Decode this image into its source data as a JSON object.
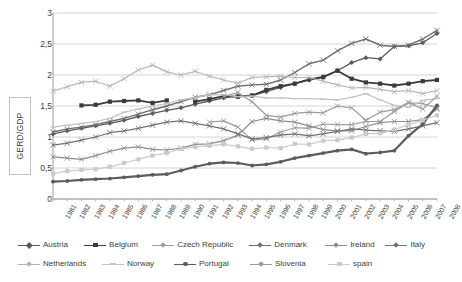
{
  "axis_title": "GERD/GDP",
  "chart_data": {
    "type": "line",
    "title": "",
    "xlabel": "",
    "ylabel": "GERD/GDP",
    "ylim": [
      0,
      3
    ],
    "yticks": [
      0,
      0.5,
      1,
      1.5,
      2,
      2.5,
      3
    ],
    "ytick_labels": [
      "0",
      "0,5",
      "1",
      "1,5",
      "2",
      "2,5",
      "3"
    ],
    "grid": true,
    "legend_position": "bottom",
    "x": [
      1981,
      1982,
      1983,
      1984,
      1985,
      1986,
      1987,
      1988,
      1989,
      1990,
      1991,
      1992,
      1993,
      1994,
      1995,
      1996,
      1997,
      1998,
      1999,
      2000,
      2001,
      2002,
      2003,
      2004,
      2005,
      2006,
      2007,
      2008
    ],
    "xtick_labels": [
      "1981",
      "1982",
      "1983",
      "1984",
      "1985",
      "1986",
      "1987",
      "1988",
      "1989",
      "1990",
      "1991",
      "1992",
      "1993",
      "1994",
      "1995",
      "1996",
      "1997",
      "1998",
      "1999",
      "2000",
      "2001",
      "2002",
      "2003",
      "2004",
      "2005",
      "2006",
      "2007",
      "2008"
    ],
    "series": [
      {
        "name": "Austria",
        "color": "#5a5a5a",
        "marker": "diamond",
        "width": 1.3,
        "values": [
          1.05,
          1.1,
          1.14,
          1.18,
          1.22,
          1.27,
          1.33,
          1.38,
          1.43,
          1.47,
          1.53,
          1.58,
          1.63,
          1.66,
          1.67,
          1.73,
          1.8,
          1.86,
          1.92,
          1.96,
          2.07,
          2.2,
          2.28,
          2.26,
          2.46,
          2.47,
          2.52,
          2.67
        ]
      },
      {
        "name": "Belgium",
        "color": "#3b3b3b",
        "marker": "square",
        "width": 1.8,
        "values": [
          null,
          null,
          1.51,
          1.52,
          1.57,
          1.58,
          1.59,
          1.55,
          1.59,
          null,
          1.57,
          1.61,
          1.66,
          1.65,
          1.67,
          1.76,
          1.82,
          1.86,
          1.93,
          1.97,
          2.07,
          1.94,
          1.88,
          1.86,
          1.83,
          1.86,
          1.9,
          1.92
        ]
      },
      {
        "name": "Czech Republic",
        "color": "#9d9d9d",
        "marker": "cross",
        "width": 1.2,
        "values": [
          null,
          null,
          null,
          null,
          null,
          null,
          null,
          null,
          null,
          null,
          null,
          1.24,
          1.26,
          1.16,
          0.95,
          0.97,
          1.08,
          1.15,
          1.14,
          1.21,
          1.2,
          1.2,
          1.25,
          1.25,
          1.41,
          1.55,
          1.54,
          1.47
        ]
      },
      {
        "name": "Denmark",
        "color": "#6e6e6e",
        "marker": "cross",
        "width": 1.4,
        "values": [
          1.08,
          1.13,
          1.16,
          1.2,
          1.25,
          1.3,
          1.37,
          1.44,
          1.5,
          1.57,
          1.64,
          1.68,
          1.75,
          1.82,
          1.84,
          1.85,
          1.92,
          2.04,
          2.18,
          2.24,
          2.39,
          2.51,
          2.58,
          2.48,
          2.46,
          2.48,
          2.58,
          2.72
        ]
      },
      {
        "name": "Ireland",
        "color": "#8c8c8c",
        "marker": "cross",
        "width": 1.2,
        "values": [
          0.68,
          0.66,
          0.64,
          0.7,
          0.77,
          0.82,
          0.84,
          0.8,
          0.79,
          0.82,
          0.88,
          0.89,
          0.94,
          1.03,
          1.25,
          1.3,
          1.26,
          1.24,
          1.18,
          1.12,
          1.1,
          1.1,
          1.17,
          1.23,
          1.25,
          1.25,
          1.28,
          1.45
        ]
      },
      {
        "name": "Italy",
        "color": "#707070",
        "marker": "cross",
        "width": 1.2,
        "values": [
          0.87,
          0.9,
          0.95,
          1.0,
          1.07,
          1.1,
          1.14,
          1.19,
          1.24,
          1.26,
          1.22,
          1.18,
          1.13,
          1.05,
          0.97,
          0.99,
          1.03,
          1.05,
          1.02,
          1.05,
          1.09,
          1.13,
          1.11,
          1.1,
          1.09,
          1.13,
          1.18,
          1.23
        ]
      },
      {
        "name": "Netherlands",
        "color": "#b5b5b5",
        "marker": "cross",
        "width": 1.2,
        "values": [
          1.74,
          1.81,
          1.88,
          1.9,
          1.82,
          1.94,
          2.08,
          2.16,
          2.05,
          2.0,
          2.06,
          1.98,
          1.92,
          1.87,
          1.96,
          1.97,
          1.98,
          1.96,
          1.96,
          1.9,
          1.84,
          1.79,
          1.8,
          1.77,
          1.73,
          1.75,
          1.7,
          1.75
        ]
      },
      {
        "name": "Norway",
        "color": "#c2c2c2",
        "marker": "dash",
        "width": 1.2,
        "values": [
          1.16,
          1.19,
          1.22,
          1.25,
          1.3,
          1.4,
          1.45,
          1.5,
          1.54,
          1.6,
          1.64,
          1.68,
          1.68,
          1.65,
          1.66,
          1.63,
          1.63,
          1.62,
          1.62,
          1.61,
          1.6,
          1.64,
          1.7,
          1.6,
          1.51,
          1.48,
          1.59,
          1.62
        ]
      },
      {
        "name": "Portugal",
        "color": "#5c5c5c",
        "marker": "round",
        "width": 2.2,
        "values": [
          0.28,
          0.29,
          0.31,
          0.32,
          0.33,
          0.35,
          0.37,
          0.39,
          0.4,
          0.46,
          0.52,
          0.57,
          0.59,
          0.58,
          0.54,
          0.56,
          0.6,
          0.66,
          0.7,
          0.74,
          0.78,
          0.8,
          0.73,
          0.75,
          0.78,
          1.02,
          1.21,
          1.51
        ]
      },
      {
        "name": "Slovenia",
        "color": "#9a9a9a",
        "marker": "cross",
        "width": 1.2,
        "values": [
          null,
          null,
          null,
          null,
          null,
          null,
          null,
          null,
          null,
          null,
          null,
          null,
          1.65,
          1.72,
          1.57,
          1.35,
          1.32,
          1.38,
          1.4,
          1.39,
          1.5,
          1.47,
          1.27,
          1.4,
          1.44,
          1.56,
          1.45,
          1.66
        ]
      },
      {
        "name": "spain",
        "color": "#cacaca",
        "marker": "square",
        "width": 1.2,
        "values": [
          0.41,
          0.45,
          0.47,
          0.48,
          0.52,
          0.58,
          0.64,
          0.7,
          0.74,
          0.81,
          0.84,
          0.86,
          0.88,
          0.85,
          0.81,
          0.83,
          0.82,
          0.89,
          0.88,
          0.94,
          0.95,
          0.99,
          1.05,
          1.06,
          1.12,
          1.2,
          1.27,
          1.35
        ]
      }
    ]
  },
  "legend": {
    "rows": [
      [
        "Austria",
        "Belgium",
        "Czech Republic",
        "Denmark",
        "Ireland",
        "Italy"
      ],
      [
        "Netherlands",
        "Norway",
        "Portugal",
        "Slovenia",
        "spain"
      ]
    ]
  }
}
